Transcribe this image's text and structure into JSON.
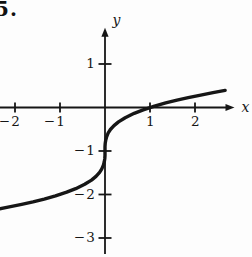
{
  "problem_number": "5.",
  "chart_data": {
    "type": "line",
    "title": "",
    "xlabel": "x",
    "ylabel": "y",
    "grid": false,
    "legend": "none",
    "xlim": [
      -2.3333,
      3.2667
    ],
    "ylim": [
      -3.437,
      2.471
    ],
    "x_ticks": [
      -2,
      -1,
      1,
      2
    ],
    "x_tick_labels": [
      "−2",
      "−1",
      "1",
      "2"
    ],
    "y_ticks": [
      1,
      -1,
      -2,
      -3
    ],
    "y_tick_labels": [
      "1",
      "−1",
      "−2",
      "−3"
    ],
    "axis": {
      "x_start": -2.3333,
      "x_end": 2.7,
      "y_start": -3.37,
      "y_end": 1.65
    },
    "curve_function_estimate": "y = cbrt(x) - 1",
    "key_points": [
      [
        -1,
        -2
      ],
      [
        0,
        -1
      ],
      [
        1,
        0
      ]
    ],
    "series": [
      {
        "name": "cube-root curve",
        "points": [
          [
            -2.35,
            -2.3296
          ],
          [
            -2.1,
            -2.2806
          ],
          [
            -1.85,
            -2.2276
          ],
          [
            -1.6,
            -2.1696
          ],
          [
            -1.35,
            -2.1052
          ],
          [
            -1.1,
            -2.0323
          ],
          [
            -0.85,
            -1.9473
          ],
          [
            -0.65,
            -1.8662
          ],
          [
            -0.45,
            -1.7663
          ],
          [
            -0.3,
            -1.6694
          ],
          [
            -0.2,
            -1.5848
          ],
          [
            -0.12,
            -1.4932
          ],
          [
            -0.07,
            -1.4121
          ],
          [
            -0.035,
            -1.3271
          ],
          [
            -0.015,
            -1.2466
          ],
          [
            -0.005,
            -1.171
          ],
          [
            -0.001,
            -1.1
          ],
          [
            0,
            -1
          ],
          [
            0.001,
            -0.9
          ],
          [
            0.005,
            -0.829
          ],
          [
            0.015,
            -0.7534
          ],
          [
            0.035,
            -0.6729
          ],
          [
            0.07,
            -0.5879
          ],
          [
            0.12,
            -0.5068
          ],
          [
            0.2,
            -0.4152
          ],
          [
            0.3,
            -0.3306
          ],
          [
            0.45,
            -0.2337
          ],
          [
            0.65,
            -0.1338
          ],
          [
            0.85,
            -0.0527
          ],
          [
            1.1,
            0.0323
          ],
          [
            1.35,
            0.1052
          ],
          [
            1.6,
            0.1696
          ],
          [
            1.85,
            0.2276
          ],
          [
            2.1,
            0.2806
          ],
          [
            2.4,
            0.3389
          ],
          [
            2.67,
            0.3934
          ]
        ]
      }
    ],
    "colors": {
      "ink": "#161616",
      "background": "#fdfdfd"
    }
  }
}
